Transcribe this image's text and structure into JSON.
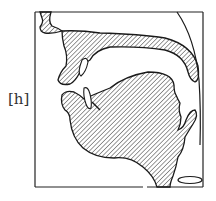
{
  "diagram": {
    "type": "midsagittal vocal tract section",
    "phoneme_label": "[h]",
    "parts": [
      {
        "id": "upper-lip",
        "label": "upper lip"
      },
      {
        "id": "palate",
        "label": "hard and soft palate"
      },
      {
        "id": "upper-teeth",
        "label": "upper teeth"
      },
      {
        "id": "lower-teeth",
        "label": "lower teeth"
      },
      {
        "id": "tongue",
        "label": "tongue and lower jaw"
      },
      {
        "id": "epiglottis",
        "label": "epiglottis"
      },
      {
        "id": "pharynx-wall",
        "label": "pharyngeal wall"
      },
      {
        "id": "glottis",
        "label": "open glottis"
      }
    ],
    "colors": {
      "outline": "#1a1a1a",
      "hatch": "#333333",
      "background": "#ffffff"
    }
  }
}
